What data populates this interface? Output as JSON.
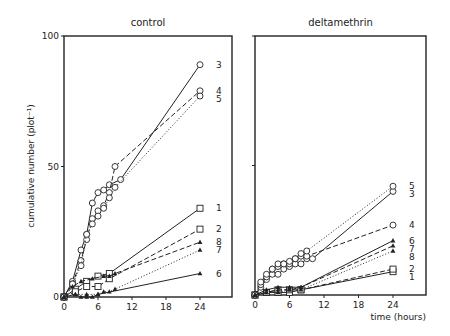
{
  "chart_data": [
    {
      "type": "line",
      "title": "control",
      "xlabel": "",
      "ylabel": "cumulative number (plot⁻¹)",
      "xlim": [
        0,
        29
      ],
      "ylim": [
        0,
        100
      ],
      "xticks": [
        0,
        6,
        12,
        18,
        24
      ],
      "yticks": [
        0,
        50,
        100
      ],
      "grid": false,
      "legend": "inline labels at line ends",
      "series": [
        {
          "name": "1",
          "marker": "square",
          "style": "solid",
          "x": [
            0,
            2,
            4,
            6,
            8,
            24
          ],
          "y": [
            0,
            3,
            6,
            8,
            9,
            34
          ]
        },
        {
          "name": "2",
          "marker": "square",
          "style": "dashed",
          "x": [
            0,
            2,
            4,
            6,
            8,
            24
          ],
          "y": [
            0,
            2,
            4,
            4,
            7,
            26
          ]
        },
        {
          "name": "3",
          "marker": "circle",
          "style": "solid",
          "x": [
            0,
            1.5,
            3,
            4,
            5,
            6,
            7,
            8,
            10,
            24
          ],
          "y": [
            0,
            6,
            18,
            24,
            36,
            40,
            41,
            43,
            45,
            89
          ]
        },
        {
          "name": "4",
          "marker": "circle",
          "style": "dashed",
          "x": [
            0,
            1.5,
            3,
            4,
            5,
            6,
            7,
            8,
            9,
            24
          ],
          "y": [
            0,
            5,
            14,
            22,
            30,
            33,
            35,
            40,
            50,
            79
          ]
        },
        {
          "name": "5",
          "marker": "circle",
          "style": "dotted",
          "x": [
            0,
            1.5,
            3,
            4,
            5,
            6,
            7,
            8,
            9,
            24
          ],
          "y": [
            0,
            5,
            12,
            24,
            28,
            31,
            34,
            38,
            42,
            77
          ]
        },
        {
          "name": "6",
          "marker": "triangle",
          "style": "solid",
          "x": [
            0,
            2,
            3,
            4,
            5,
            6,
            24
          ],
          "y": [
            0,
            1,
            0,
            0,
            0,
            1,
            9
          ]
        },
        {
          "name": "7",
          "marker": "triangle",
          "style": "dotted",
          "x": [
            0,
            2,
            4,
            6,
            7,
            8,
            9,
            24
          ],
          "y": [
            0,
            1,
            1,
            1,
            2,
            2,
            3,
            18
          ]
        },
        {
          "name": "8",
          "marker": "triangle",
          "style": "dashed",
          "x": [
            0,
            1.5,
            3,
            5,
            7,
            8,
            9,
            24
          ],
          "y": [
            0,
            4,
            6,
            7,
            8,
            8,
            9,
            21
          ]
        }
      ],
      "end_labels": [
        "3",
        "4",
        "5",
        "1",
        "2",
        "8",
        "7",
        "6"
      ]
    },
    {
      "type": "line",
      "title": "deltamethrin",
      "xlabel": "time (hours)",
      "ylabel": "",
      "xlim": [
        0,
        29
      ],
      "ylim": [
        0,
        100
      ],
      "xticks": [
        0,
        6,
        12,
        18,
        24
      ],
      "grid": false,
      "legend": "inline labels at line ends",
      "series": [
        {
          "name": "1",
          "marker": "square",
          "style": "solid",
          "x": [
            0,
            2,
            4,
            6,
            8,
            24
          ],
          "y": [
            0,
            1,
            1,
            1,
            2,
            9
          ]
        },
        {
          "name": "2",
          "marker": "square",
          "style": "dashed",
          "x": [
            0,
            2,
            4,
            6,
            8,
            24
          ],
          "y": [
            0,
            1,
            2,
            2,
            2,
            10
          ]
        },
        {
          "name": "3",
          "marker": "circle",
          "style": "solid",
          "x": [
            0,
            1,
            2,
            3,
            4,
            5,
            6,
            7,
            8,
            9,
            10,
            24
          ],
          "y": [
            0,
            3,
            6,
            8,
            8,
            10,
            11,
            12,
            12,
            14,
            14,
            40
          ]
        },
        {
          "name": "4",
          "marker": "circle",
          "style": "dashed",
          "x": [
            0,
            1,
            2,
            3,
            4,
            5,
            6,
            7,
            8,
            9,
            24
          ],
          "y": [
            0,
            4,
            7,
            10,
            11,
            12,
            12,
            14,
            15,
            15,
            27
          ]
        },
        {
          "name": "5",
          "marker": "circle",
          "style": "dotted",
          "x": [
            0,
            1,
            2,
            3,
            4,
            5,
            6,
            7,
            8,
            9,
            24
          ],
          "y": [
            0,
            5,
            8,
            10,
            12,
            12,
            13,
            14,
            16,
            17,
            42
          ]
        },
        {
          "name": "6",
          "marker": "triangle",
          "style": "solid",
          "x": [
            0,
            2,
            4,
            6,
            8,
            24
          ],
          "y": [
            0,
            2,
            3,
            3,
            3,
            21
          ]
        },
        {
          "name": "7",
          "marker": "triangle",
          "style": "dashed",
          "x": [
            0,
            2,
            4,
            6,
            8,
            24
          ],
          "y": [
            0,
            1,
            2,
            2,
            3,
            19
          ]
        },
        {
          "name": "8",
          "marker": "triangle",
          "style": "dotted",
          "x": [
            0,
            2,
            4,
            6,
            8,
            24
          ],
          "y": [
            0,
            1,
            1,
            2,
            2,
            17
          ]
        }
      ],
      "end_labels": [
        "5",
        "3",
        "4",
        "6",
        "7",
        "8",
        "2",
        "1"
      ]
    }
  ],
  "labels": {
    "left_title": "control",
    "right_title": "deltamethrin",
    "ylabel": "cumulative number (plot⁻¹)",
    "xlabel": "time (hours)",
    "xticks": [
      "0",
      "6",
      "12",
      "18",
      "24"
    ],
    "yticks": [
      "0",
      "50",
      "100"
    ]
  }
}
